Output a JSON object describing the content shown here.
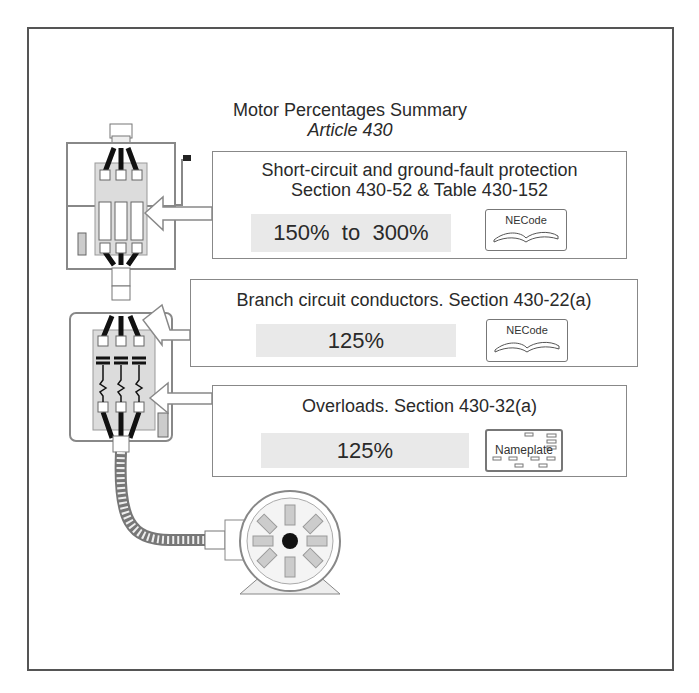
{
  "diagram": {
    "title": "Motor Percentages Summary",
    "subtitle": "Article 430",
    "callouts": [
      {
        "id": "short-circuit",
        "heading_line1": "Short-circuit and ground-fault protection",
        "heading_line2": "Section 430-52 & Table 430-152",
        "percentage": "150%  to  300%",
        "reference_label": "NECode",
        "reference_icon": "open-book-icon",
        "points_to": "fuses in disconnect switch"
      },
      {
        "id": "branch-conductors",
        "heading_line1": "Branch circuit conductors. Section 430-22(a)",
        "percentage": "125%",
        "reference_label": "NECode",
        "reference_icon": "open-book-icon",
        "points_to": "conductors in motor starter"
      },
      {
        "id": "overloads",
        "heading_line1": "Overloads. Section 430-32(a)",
        "percentage": "125%",
        "reference_label": "Nameplate",
        "reference_icon": "nameplate-icon",
        "points_to": "overload heaters in motor starter"
      }
    ],
    "components": [
      "fused-disconnect-switch",
      "motor-starter",
      "flexible-conduit",
      "electric-motor"
    ],
    "colors": {
      "frame": "#555555",
      "callout_border": "#888888",
      "percentage_fill": "#e9e9e9",
      "panel_fill": "#dcdcdc",
      "conductor": "#111111"
    }
  }
}
